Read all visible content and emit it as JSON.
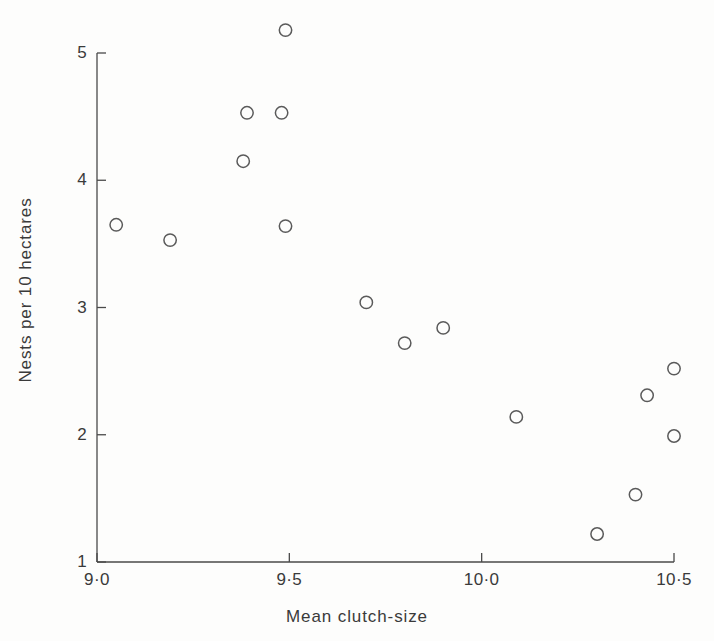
{
  "chart_data": {
    "type": "scatter",
    "title": "",
    "xlabel": "Mean clutch-size",
    "ylabel": "Nests per 10 hectares",
    "xlim": [
      9.0,
      10.5
    ],
    "ylim": [
      1,
      5
    ],
    "grid": false,
    "legend": null,
    "marker": "open-circle",
    "xticks": [
      9.0,
      9.5,
      10.0,
      10.5
    ],
    "xtick_labels": [
      "9·0",
      "9·5",
      "10·0",
      "10·5"
    ],
    "yticks": [
      1,
      2,
      3,
      4,
      5
    ],
    "ytick_labels": [
      "1",
      "2",
      "3",
      "4",
      "5"
    ],
    "points": [
      {
        "x": 9.05,
        "y": 3.65
      },
      {
        "x": 9.19,
        "y": 3.53
      },
      {
        "x": 9.38,
        "y": 4.15
      },
      {
        "x": 9.39,
        "y": 4.53
      },
      {
        "x": 9.48,
        "y": 4.53
      },
      {
        "x": 9.49,
        "y": 5.18
      },
      {
        "x": 9.49,
        "y": 3.64
      },
      {
        "x": 9.7,
        "y": 3.04
      },
      {
        "x": 9.8,
        "y": 2.72
      },
      {
        "x": 9.9,
        "y": 2.84
      },
      {
        "x": 10.09,
        "y": 2.14
      },
      {
        "x": 10.3,
        "y": 1.22
      },
      {
        "x": 10.4,
        "y": 1.53
      },
      {
        "x": 10.43,
        "y": 2.31
      },
      {
        "x": 10.5,
        "y": 2.52
      },
      {
        "x": 10.5,
        "y": 1.99
      }
    ],
    "colors": {
      "marker_stroke": "#5a5a5a",
      "axis": "#4a4a4a",
      "text": "#3a3a3a",
      "background": "#fdfdfc"
    }
  }
}
